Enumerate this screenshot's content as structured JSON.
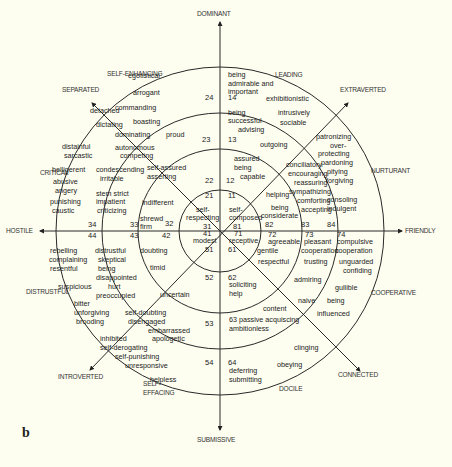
{
  "figure_label": "b",
  "geometry": {
    "cx": 220,
    "cy": 231,
    "radii": [
      164,
      118,
      82,
      41
    ]
  },
  "axes": {
    "dominant": "DOMINANT",
    "submissive": "SUBMISSIVE",
    "hostile": "HOSTILE",
    "friendly": "FRIENDLY",
    "separated": "SEPARATED",
    "extraverted": "EXTRAVERTED",
    "introverted": "INTROVERTED",
    "connected": "CONNECTED"
  },
  "octants": {
    "self_enhancing": "SELF-ENHANCING",
    "leading": "LEADING",
    "nurturant": "NURTURANT",
    "cooperative": "COOPERATIVE",
    "docile": "DOCILE",
    "self_effacing_1": "SELF-",
    "self_effacing_2": "EFFACING",
    "distrustful": "DISTRUSTFUL",
    "critical": "CRITICAL"
  },
  "terms": [
    {
      "t": "egotistical",
      "x": 128,
      "y": 78
    },
    {
      "t": "arrogant",
      "x": 133,
      "y": 95
    },
    {
      "t": "commanding",
      "x": 115,
      "y": 110
    },
    {
      "t": "detached",
      "x": 90,
      "y": 113
    },
    {
      "t": "boasting",
      "x": 133,
      "y": 124
    },
    {
      "t": "dictating",
      "x": 96,
      "y": 127
    },
    {
      "t": "dominating",
      "x": 115,
      "y": 137
    },
    {
      "t": "proud",
      "x": 166,
      "y": 137
    },
    {
      "t": "autonomous",
      "x": 115,
      "y": 150
    },
    {
      "t": "competing",
      "x": 120,
      "y": 158
    },
    {
      "t": "distainful",
      "x": 62,
      "y": 149
    },
    {
      "t": "sarcastic",
      "x": 64,
      "y": 158
    },
    {
      "t": "belligerent",
      "x": 52,
      "y": 172
    },
    {
      "t": "self-assured",
      "x": 147,
      "y": 170
    },
    {
      "t": "asserting",
      "x": 147,
      "y": 179
    },
    {
      "t": "condescending",
      "x": 96,
      "y": 172
    },
    {
      "t": "irritable",
      "x": 100,
      "y": 181
    },
    {
      "t": "abusive",
      "x": 53,
      "y": 184
    },
    {
      "t": "angery",
      "x": 55,
      "y": 193
    },
    {
      "t": "stem  strict",
      "x": 96,
      "y": 196
    },
    {
      "t": "impatient",
      "x": 96,
      "y": 204
    },
    {
      "t": "criticizing",
      "x": 97,
      "y": 213
    },
    {
      "t": "punishing",
      "x": 50,
      "y": 204
    },
    {
      "t": "caustic",
      "x": 52,
      "y": 213
    },
    {
      "t": "indifferent",
      "x": 142,
      "y": 205
    },
    {
      "t": "shrewd",
      "x": 140,
      "y": 221
    },
    {
      "t": "firm",
      "x": 140,
      "y": 229
    },
    {
      "t": "self-",
      "x": 196,
      "y": 212
    },
    {
      "t": "respecting",
      "x": 186,
      "y": 220
    },
    {
      "t": "self-",
      "x": 229,
      "y": 212
    },
    {
      "t": "composed",
      "x": 229,
      "y": 220
    },
    {
      "t": "modest",
      "x": 193,
      "y": 243
    },
    {
      "t": "receptive",
      "x": 229,
      "y": 243
    },
    {
      "t": "rebelling",
      "x": 50,
      "y": 253
    },
    {
      "t": "complaining",
      "x": 49,
      "y": 262
    },
    {
      "t": "resentful",
      "x": 50,
      "y": 271
    },
    {
      "t": "distrustful",
      "x": 95,
      "y": 253
    },
    {
      "t": "skeptical",
      "x": 98,
      "y": 262
    },
    {
      "t": "being",
      "x": 98,
      "y": 271
    },
    {
      "t": "disappointed",
      "x": 96,
      "y": 280
    },
    {
      "t": "hurt",
      "x": 108,
      "y": 289
    },
    {
      "t": "preoccupied",
      "x": 96,
      "y": 298
    },
    {
      "t": "doubting",
      "x": 140,
      "y": 253
    },
    {
      "t": "timid",
      "x": 150,
      "y": 270
    },
    {
      "t": "suspicious",
      "x": 58,
      "y": 289
    },
    {
      "t": "uncertain",
      "x": 160,
      "y": 297
    },
    {
      "t": "bitter",
      "x": 74,
      "y": 306
    },
    {
      "t": "unforgiving",
      "x": 74,
      "y": 315
    },
    {
      "t": "brooding",
      "x": 76,
      "y": 324
    },
    {
      "t": "self-doubting",
      "x": 125,
      "y": 315
    },
    {
      "t": "disengaged",
      "x": 128,
      "y": 324
    },
    {
      "t": "embarrassed",
      "x": 148,
      "y": 333
    },
    {
      "t": "apologetic",
      "x": 152,
      "y": 341
    },
    {
      "t": "inhibited",
      "x": 100,
      "y": 341
    },
    {
      "t": "self-derogating",
      "x": 100,
      "y": 350
    },
    {
      "t": "self-punishing",
      "x": 115,
      "y": 359
    },
    {
      "t": "unresponsive",
      "x": 125,
      "y": 368
    },
    {
      "t": "helpless",
      "x": 150,
      "y": 382
    },
    {
      "t": "being",
      "x": 228,
      "y": 77
    },
    {
      "t": "admirable and",
      "x": 228,
      "y": 86
    },
    {
      "t": "important",
      "x": 228,
      "y": 94
    },
    {
      "t": "exhibitionistic",
      "x": 266,
      "y": 101
    },
    {
      "t": "being",
      "x": 228,
      "y": 115
    },
    {
      "t": "successful",
      "x": 228,
      "y": 123
    },
    {
      "t": "advising",
      "x": 238,
      "y": 132
    },
    {
      "t": "intrusively",
      "x": 278,
      "y": 115
    },
    {
      "t": "sociable",
      "x": 280,
      "y": 125
    },
    {
      "t": "outgoing",
      "x": 260,
      "y": 147
    },
    {
      "t": "patronizing",
      "x": 316,
      "y": 139
    },
    {
      "t": "over-",
      "x": 330,
      "y": 148
    },
    {
      "t": "protecting",
      "x": 318,
      "y": 156
    },
    {
      "t": "pardoning",
      "x": 321,
      "y": 165
    },
    {
      "t": "pitying",
      "x": 327,
      "y": 174
    },
    {
      "t": "forgiving",
      "x": 326,
      "y": 183
    },
    {
      "t": "assured",
      "x": 234,
      "y": 161
    },
    {
      "t": "being",
      "x": 234,
      "y": 170
    },
    {
      "t": "capable",
      "x": 240,
      "y": 179
    },
    {
      "t": "conciliatory",
      "x": 286,
      "y": 167
    },
    {
      "t": "encouraging",
      "x": 288,
      "y": 176
    },
    {
      "t": "reassuring",
      "x": 294,
      "y": 185
    },
    {
      "t": "sympathizing",
      "x": 289,
      "y": 194
    },
    {
      "t": "comforting",
      "x": 297,
      "y": 203
    },
    {
      "t": "accepting",
      "x": 301,
      "y": 212
    },
    {
      "t": "consoling",
      "x": 327,
      "y": 202
    },
    {
      "t": "indulgent",
      "x": 327,
      "y": 211
    },
    {
      "t": "helping",
      "x": 266,
      "y": 197
    },
    {
      "t": "being",
      "x": 271,
      "y": 210
    },
    {
      "t": "considerate",
      "x": 261,
      "y": 218
    },
    {
      "t": "agreeable",
      "x": 268,
      "y": 244
    },
    {
      "t": "gentile",
      "x": 257,
      "y": 253
    },
    {
      "t": "respectful",
      "x": 258,
      "y": 264
    },
    {
      "t": "pleasant",
      "x": 304,
      "y": 244
    },
    {
      "t": "cooperation",
      "x": 301,
      "y": 253
    },
    {
      "t": "trusting",
      "x": 304,
      "y": 264
    },
    {
      "t": "compulsive",
      "x": 337,
      "y": 244
    },
    {
      "t": "cooperation",
      "x": 335,
      "y": 253
    },
    {
      "t": "unguarded",
      "x": 339,
      "y": 264
    },
    {
      "t": "confiding",
      "x": 343,
      "y": 273
    },
    {
      "t": "soliciting",
      "x": 229,
      "y": 287
    },
    {
      "t": "help",
      "x": 229,
      "y": 296
    },
    {
      "t": "admiring",
      "x": 294,
      "y": 282
    },
    {
      "t": "gullible",
      "x": 335,
      "y": 290
    },
    {
      "t": "naive",
      "x": 298,
      "y": 303
    },
    {
      "t": "being",
      "x": 327,
      "y": 303
    },
    {
      "t": "influenced",
      "x": 317,
      "y": 316
    },
    {
      "t": "content",
      "x": 263,
      "y": 311
    },
    {
      "t": "63 passive acquiscing",
      "x": 229,
      "y": 322
    },
    {
      "t": "ambitionless",
      "x": 229,
      "y": 331
    },
    {
      "t": "clinging",
      "x": 294,
      "y": 350
    },
    {
      "t": "obeying",
      "x": 277,
      "y": 367
    },
    {
      "t": "deferring",
      "x": 229,
      "y": 373
    },
    {
      "t": "submitting",
      "x": 229,
      "y": 382
    }
  ],
  "numbers": [
    {
      "t": "24",
      "x": 205,
      "y": 99
    },
    {
      "t": "14",
      "x": 228,
      "y": 99
    },
    {
      "t": "23",
      "x": 202,
      "y": 141
    },
    {
      "t": "13",
      "x": 228,
      "y": 141
    },
    {
      "t": "22",
      "x": 205,
      "y": 182
    },
    {
      "t": "12",
      "x": 226,
      "y": 182
    },
    {
      "t": "21",
      "x": 205,
      "y": 197
    },
    {
      "t": "11",
      "x": 228,
      "y": 197
    },
    {
      "t": "31",
      "x": 203,
      "y": 228
    },
    {
      "t": "81",
      "x": 233,
      "y": 228
    },
    {
      "t": "32",
      "x": 165,
      "y": 225
    },
    {
      "t": "33",
      "x": 130,
      "y": 226
    },
    {
      "t": "34",
      "x": 88,
      "y": 226
    },
    {
      "t": "82",
      "x": 265,
      "y": 226
    },
    {
      "t": "83",
      "x": 301,
      "y": 226
    },
    {
      "t": "84",
      "x": 327,
      "y": 226
    },
    {
      "t": "41",
      "x": 203,
      "y": 235
    },
    {
      "t": "71",
      "x": 234,
      "y": 235
    },
    {
      "t": "51",
      "x": 205,
      "y": 251
    },
    {
      "t": "61",
      "x": 228,
      "y": 251
    },
    {
      "t": "42",
      "x": 162,
      "y": 237
    },
    {
      "t": "43",
      "x": 130,
      "y": 237
    },
    {
      "t": "44",
      "x": 88,
      "y": 237
    },
    {
      "t": "72",
      "x": 268,
      "y": 236
    },
    {
      "t": "73",
      "x": 305,
      "y": 236
    },
    {
      "t": "74",
      "x": 337,
      "y": 236
    },
    {
      "t": "52",
      "x": 205,
      "y": 279
    },
    {
      "t": "62",
      "x": 228,
      "y": 279
    },
    {
      "t": "53",
      "x": 205,
      "y": 325
    },
    {
      "t": "54",
      "x": 205,
      "y": 364
    },
    {
      "t": "64",
      "x": 228,
      "y": 364
    }
  ]
}
